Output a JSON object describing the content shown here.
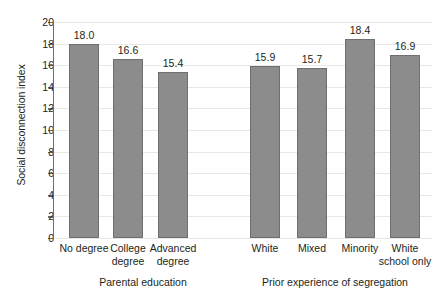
{
  "chart_data": {
    "type": "bar",
    "title": "",
    "subtitle": "",
    "xlabel": "",
    "ylabel": "Social disconnection index",
    "ylim": [
      0,
      20
    ],
    "ytick_step": 2,
    "yticks": [
      "20",
      "18",
      "16",
      "14",
      "12",
      "10",
      "8",
      "6",
      "4",
      "2",
      "0"
    ],
    "grid": true,
    "legend": "none",
    "bar_color": "#8c8c8c",
    "bar_border_color": "#6f6f6f",
    "gridline_color": "#e9e7e4",
    "axis_color": "#6d6e70",
    "text_color": "#231f20",
    "groups": [
      {
        "name": "Parental education",
        "categories": [
          "No degree",
          "College degree",
          "Advanced degree"
        ],
        "category_lines": [
          [
            "No degree"
          ],
          [
            "College",
            "degree"
          ],
          [
            "Advanced",
            "degree"
          ]
        ],
        "values": [
          18.0,
          16.6,
          15.4
        ],
        "labels": [
          "18.0",
          "16.6",
          "15.4"
        ]
      },
      {
        "name": "Prior experience of segregation",
        "categories": [
          "White",
          "Mixed",
          "Minority",
          "White school only"
        ],
        "category_lines": [
          [
            "White"
          ],
          [
            "Mixed"
          ],
          [
            "Minority"
          ],
          [
            "White",
            "school only"
          ]
        ],
        "values": [
          15.9,
          15.7,
          18.4,
          16.9
        ],
        "labels": [
          "15.9",
          "15.7",
          "18.4",
          "16.9"
        ]
      }
    ],
    "categories": [
      "No degree",
      "College degree",
      "Advanced degree",
      "White",
      "Mixed",
      "Minority",
      "White school only"
    ],
    "values": [
      18.0,
      16.6,
      15.4,
      15.9,
      15.7,
      18.4,
      16.9
    ]
  }
}
